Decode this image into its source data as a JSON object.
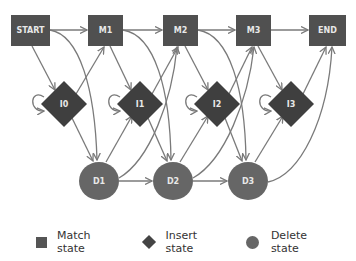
{
  "diagram": {
    "colors": {
      "match": "#505050",
      "insert": "#3f3f3f",
      "delete": "#666666",
      "edge": "#7a7a7a",
      "label": "#e8e8e8"
    },
    "match_states": [
      {
        "id": "START",
        "label": "START"
      },
      {
        "id": "M1",
        "label": "M1"
      },
      {
        "id": "M2",
        "label": "M2"
      },
      {
        "id": "M3",
        "label": "M3"
      },
      {
        "id": "END",
        "label": "END"
      }
    ],
    "insert_states": [
      {
        "id": "I0",
        "label": "I0"
      },
      {
        "id": "I1",
        "label": "I1"
      },
      {
        "id": "I2",
        "label": "I2"
      },
      {
        "id": "I3",
        "label": "I3"
      }
    ],
    "delete_states": [
      {
        "id": "D1",
        "label": "D1"
      },
      {
        "id": "D2",
        "label": "D2"
      },
      {
        "id": "D3",
        "label": "D3"
      }
    ]
  },
  "legend": {
    "match": "Match state",
    "insert": "Insert state",
    "delete": "Delete state"
  }
}
